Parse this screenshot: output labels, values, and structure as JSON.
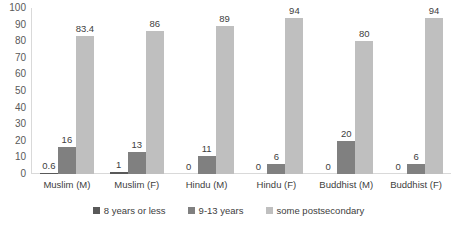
{
  "chart_data": {
    "type": "bar",
    "title": "",
    "subtitle": "",
    "xlabel": "",
    "ylabel": "",
    "ylim": [
      0,
      100
    ],
    "ytick_step": 10,
    "yticks": [
      100,
      90,
      80,
      70,
      60,
      50,
      40,
      30,
      20,
      10,
      0
    ],
    "grid": false,
    "legend_position": "bottom",
    "orientation": "vertical",
    "grouping": "clustered",
    "categories": [
      "Muslim (M)",
      "Muslim (F)",
      "Hindu (M)",
      "Hindu (F)",
      "Buddhist (M)",
      "Buddhist (F)"
    ],
    "series": [
      {
        "name": "8 years or less",
        "color": "#595959",
        "values": [
          0.6,
          1,
          0,
          0,
          0,
          0
        ],
        "labels": [
          "0.6",
          "1",
          "0",
          "0",
          "0",
          "0"
        ]
      },
      {
        "name": "9-13 years",
        "color": "#808080",
        "values": [
          16,
          13,
          11,
          6,
          20,
          6
        ],
        "labels": [
          "16",
          "13",
          "11",
          "6",
          "20",
          "6"
        ]
      },
      {
        "name": "some postsecondary",
        "color": "#BFBFBF",
        "values": [
          83.4,
          86,
          89,
          94,
          80,
          94
        ],
        "labels": [
          "83.4",
          "86",
          "89",
          "94",
          "80",
          "94"
        ]
      }
    ]
  },
  "axis": {
    "y_tick_0": "0",
    "y_tick_10": "10",
    "y_tick_20": "20",
    "y_tick_30": "30",
    "y_tick_40": "40",
    "y_tick_50": "50",
    "y_tick_60": "60",
    "y_tick_70": "70",
    "y_tick_80": "80",
    "y_tick_90": "90",
    "y_tick_100": "100"
  },
  "colors": {
    "background": "#FFFFFF",
    "axis_line": "#D9D9D9",
    "text": "#404040",
    "series_1": "#595959",
    "series_2": "#808080",
    "series_3": "#BFBFBF"
  }
}
